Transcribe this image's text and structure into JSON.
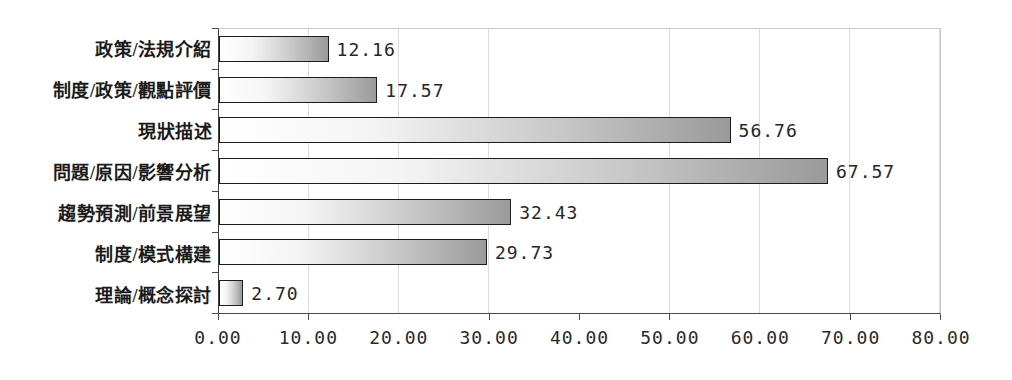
{
  "chart_data": {
    "type": "bar",
    "orientation": "horizontal",
    "title": "",
    "xlabel": "",
    "ylabel": "",
    "categories": [
      "政策/法規介紹",
      "制度/政策/觀點評價",
      "現狀描述",
      "問題/原因/影響分析",
      "趨勢預測/前景展望",
      "制度/模式構建",
      "理論/概念探討"
    ],
    "values": [
      12.16,
      17.57,
      56.76,
      67.57,
      32.43,
      29.73,
      2.7
    ],
    "value_labels": [
      "12.16",
      "17.57",
      "56.76",
      "67.57",
      "32.43",
      "29.73",
      "2.70"
    ],
    "xlim": [
      0,
      80
    ],
    "x_tick_step": 10,
    "x_tick_labels": [
      "0.00",
      "10.00",
      "20.00",
      "30.00",
      "40.00",
      "50.00",
      "60.00",
      "70.00",
      "80.00"
    ],
    "grid": "vertical-gridlines-on",
    "legend": "none",
    "colors": {
      "bar_gradient_start": "#ffffff",
      "bar_gradient_end": "#9a9a9a",
      "bar_border": "#1c1c1c",
      "gridline": "#dcdcdc",
      "axis": "#4a4a4a",
      "text": "#1f1f1f",
      "background": "#ffffff"
    }
  }
}
